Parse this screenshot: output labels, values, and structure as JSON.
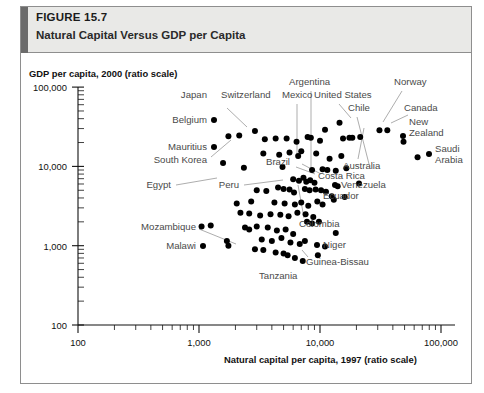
{
  "header": {
    "figure_number_prefix": "F",
    "figure_number_small": "IGURE",
    "figure_number_value": " 15.7",
    "figure_number_full": "FIGURE 15.7",
    "title": "Natural Capital Versus GDP per Capita",
    "accent_color": "#6b6b6b",
    "background_color": "#e9e9e7"
  },
  "chart_data": {
    "type": "scatter",
    "title": "Natural Capital Versus GDP per Capita",
    "xlabel": "Natural capital per capita, 1997 (ratio scale)",
    "ylabel": "GDP per capita, 2000 (ratio scale)",
    "xscale": "log",
    "yscale": "log",
    "xlim": [
      100,
      200000
    ],
    "ylim": [
      100,
      100000
    ],
    "grid": false,
    "legend": "none",
    "xticks": [
      100,
      1000,
      10000,
      100000
    ],
    "xtick_labels": [
      "100",
      "1,000",
      "10,000",
      "100,000"
    ],
    "yticks": [
      100,
      1000,
      10000,
      100000
    ],
    "ytick_labels": [
      "100",
      "1,000",
      "10,000",
      "100,000"
    ],
    "marker_color": "#000000",
    "annotations": [
      {
        "label": "Japan",
        "x": 1350,
        "y": 34000
      },
      {
        "label": "Switzerland",
        "x": 1900,
        "y": 34000
      },
      {
        "label": "Belgium",
        "x": 1450,
        "y": 23000
      },
      {
        "label": "Mauritius",
        "x": 1500,
        "y": 11500
      },
      {
        "label": "South Korea",
        "x": 2000,
        "y": 9800
      },
      {
        "label": "Egypt",
        "x": 1400,
        "y": 4200
      },
      {
        "label": "Peru",
        "x": 2600,
        "y": 4500
      },
      {
        "label": "Brazil",
        "x": 5200,
        "y": 8000
      },
      {
        "label": "Mexico",
        "x": 7600,
        "y": 33000
      },
      {
        "label": "Argentina",
        "x": 11000,
        "y": 46000
      },
      {
        "label": "United States",
        "x": 16000,
        "y": 39000
      },
      {
        "label": "Chile",
        "x": 20000,
        "y": 31000
      },
      {
        "label": "Norway",
        "x": 33000,
        "y": 46000
      },
      {
        "label": "Canada",
        "x": 52000,
        "y": 33000
      },
      {
        "label": "New Zealand",
        "x": 56000,
        "y": 22000
      },
      {
        "label": "Saudi Arabia",
        "x": 72000,
        "y": 14000
      },
      {
        "label": "Australia",
        "x": 23000,
        "y": 9000
      },
      {
        "label": "Venezuela",
        "x": 26000,
        "y": 6200
      },
      {
        "label": "Costa Rica",
        "x": 17000,
        "y": 6800
      },
      {
        "label": "Ecuador",
        "x": 18000,
        "y": 4000
      },
      {
        "label": "Colombia",
        "x": 13000,
        "y": 2400
      },
      {
        "label": "Niger",
        "x": 17000,
        "y": 1500
      },
      {
        "label": "Guinea-Bissau",
        "x": 14000,
        "y": 1000
      },
      {
        "label": "Tanzania",
        "x": 7000,
        "y": 700
      },
      {
        "label": "Mozambique",
        "x": 700,
        "y": 1900
      },
      {
        "label": "Malawi",
        "x": 820,
        "y": 1050
      }
    ],
    "points": [
      {
        "x": 1750,
        "y": 24000
      },
      {
        "x": 2150,
        "y": 24500
      },
      {
        "x": 2900,
        "y": 28000
      },
      {
        "x": 3500,
        "y": 22000
      },
      {
        "x": 4300,
        "y": 22500
      },
      {
        "x": 5300,
        "y": 22500
      },
      {
        "x": 6400,
        "y": 20500
      },
      {
        "x": 7900,
        "y": 23500
      },
      {
        "x": 8400,
        "y": 23000
      },
      {
        "x": 3400,
        "y": 14500
      },
      {
        "x": 4600,
        "y": 14000
      },
      {
        "x": 5600,
        "y": 15000
      },
      {
        "x": 6600,
        "y": 13500
      },
      {
        "x": 1580,
        "y": 11000
      },
      {
        "x": 9300,
        "y": 14500
      },
      {
        "x": 11000,
        "y": 29000
      },
      {
        "x": 14500,
        "y": 35500
      },
      {
        "x": 15500,
        "y": 22500
      },
      {
        "x": 17500,
        "y": 23000
      },
      {
        "x": 18500,
        "y": 23000
      },
      {
        "x": 21500,
        "y": 23500
      },
      {
        "x": 31000,
        "y": 28500
      },
      {
        "x": 36000,
        "y": 28500
      },
      {
        "x": 49000,
        "y": 20500
      },
      {
        "x": 64000,
        "y": 13000
      },
      {
        "x": 8600,
        "y": 9000
      },
      {
        "x": 10500,
        "y": 9200
      },
      {
        "x": 11500,
        "y": 9000
      },
      {
        "x": 13500,
        "y": 8800
      },
      {
        "x": 16500,
        "y": 9500
      },
      {
        "x": 21000,
        "y": 6100
      },
      {
        "x": 6000,
        "y": 6900
      },
      {
        "x": 6700,
        "y": 6600
      },
      {
        "x": 7300,
        "y": 7200
      },
      {
        "x": 7700,
        "y": 6400
      },
      {
        "x": 8300,
        "y": 6700
      },
      {
        "x": 9000,
        "y": 6200
      },
      {
        "x": 7500,
        "y": 5200
      },
      {
        "x": 8200,
        "y": 5000
      },
      {
        "x": 9200,
        "y": 5100
      },
      {
        "x": 10200,
        "y": 5000
      },
      {
        "x": 11200,
        "y": 4800
      },
      {
        "x": 3000,
        "y": 5000
      },
      {
        "x": 3600,
        "y": 4900
      },
      {
        "x": 4500,
        "y": 5400
      },
      {
        "x": 5000,
        "y": 5200
      },
      {
        "x": 5600,
        "y": 5100
      },
      {
        "x": 6100,
        "y": 4700
      },
      {
        "x": 12500,
        "y": 4200
      },
      {
        "x": 13000,
        "y": 3800
      },
      {
        "x": 2700,
        "y": 3600
      },
      {
        "x": 4200,
        "y": 3500
      },
      {
        "x": 5100,
        "y": 3400
      },
      {
        "x": 6200,
        "y": 3300
      },
      {
        "x": 7000,
        "y": 3500
      },
      {
        "x": 8000,
        "y": 3200
      },
      {
        "x": 9500,
        "y": 3600
      },
      {
        "x": 10500,
        "y": 3300
      },
      {
        "x": 2200,
        "y": 2600
      },
      {
        "x": 2600,
        "y": 2550
      },
      {
        "x": 3200,
        "y": 2400
      },
      {
        "x": 3900,
        "y": 2500
      },
      {
        "x": 4700,
        "y": 2450
      },
      {
        "x": 5500,
        "y": 2350
      },
      {
        "x": 6500,
        "y": 2600
      },
      {
        "x": 7600,
        "y": 2500
      },
      {
        "x": 8800,
        "y": 2300
      },
      {
        "x": 1050,
        "y": 1750
      },
      {
        "x": 1250,
        "y": 1800
      },
      {
        "x": 1700,
        "y": 1150
      },
      {
        "x": 1750,
        "y": 1000
      },
      {
        "x": 2400,
        "y": 1700
      },
      {
        "x": 2600,
        "y": 1600
      },
      {
        "x": 3000,
        "y": 1750
      },
      {
        "x": 3700,
        "y": 1700
      },
      {
        "x": 4400,
        "y": 1550
      },
      {
        "x": 5200,
        "y": 1600
      },
      {
        "x": 6000,
        "y": 1400
      },
      {
        "x": 3300,
        "y": 1200
      },
      {
        "x": 4000,
        "y": 1150
      },
      {
        "x": 4800,
        "y": 1250
      },
      {
        "x": 5700,
        "y": 1100
      },
      {
        "x": 6800,
        "y": 1050
      },
      {
        "x": 7500,
        "y": 1150
      },
      {
        "x": 2900,
        "y": 900
      },
      {
        "x": 3400,
        "y": 880
      },
      {
        "x": 4300,
        "y": 820
      },
      {
        "x": 5000,
        "y": 800
      },
      {
        "x": 5400,
        "y": 760
      },
      {
        "x": 6200,
        "y": 700
      },
      {
        "x": 7200,
        "y": 640
      },
      {
        "x": 13500,
        "y": 1450
      },
      {
        "x": 11000,
        "y": 980
      },
      {
        "x": 9600,
        "y": 760
      },
      {
        "x": 2050,
        "y": 3400
      },
      {
        "x": 2350,
        "y": 9600
      },
      {
        "x": 4900,
        "y": 9800
      },
      {
        "x": 15000,
        "y": 13500
      },
      {
        "x": 12000,
        "y": 12500
      },
      {
        "x": 10000,
        "y": 21000
      },
      {
        "x": 7000,
        "y": 15500
      },
      {
        "x": 14000,
        "y": 5600
      },
      {
        "x": 16000,
        "y": 4100
      },
      {
        "x": 9800,
        "y": 2000
      },
      {
        "x": 8600,
        "y": 1900
      },
      {
        "x": 7800,
        "y": 2000
      }
    ]
  }
}
